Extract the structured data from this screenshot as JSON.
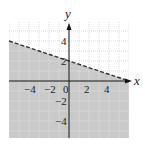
{
  "chart_data": {
    "type": "area",
    "title": "",
    "xlabel": "x",
    "ylabel": "y",
    "xlim": [
      -6,
      6
    ],
    "ylim": [
      -6,
      6
    ],
    "grid": true,
    "x_ticks": [
      "-4",
      "-2",
      "0",
      "2",
      "4"
    ],
    "y_ticks": [
      "4",
      "2",
      "-2",
      "-4"
    ],
    "boundary_line": {
      "style": "dashed",
      "slope": -0.3333,
      "intercept": 2,
      "points": [
        [
          -6,
          4
        ],
        [
          0,
          2
        ],
        [
          6,
          0
        ]
      ]
    },
    "shaded_region": "below",
    "colors": {
      "shade": "#c9c9c9",
      "grid": "#b8b8b8",
      "line": "#333333",
      "axis": "#111111"
    }
  },
  "labels": {
    "x_axis": "x",
    "y_axis": "y",
    "x_ticks": [
      {
        "text": "−4",
        "x": -4
      },
      {
        "text": "−2",
        "x": -2
      },
      {
        "text": "0",
        "x": 0
      },
      {
        "text": "2",
        "x": 2
      },
      {
        "text": "4",
        "x": 4
      }
    ],
    "y_ticks": [
      {
        "text": "4",
        "y": 4
      },
      {
        "text": "2",
        "y": 2
      },
      {
        "text": "−2",
        "y": -2
      },
      {
        "text": "−4",
        "y": -4
      }
    ]
  }
}
